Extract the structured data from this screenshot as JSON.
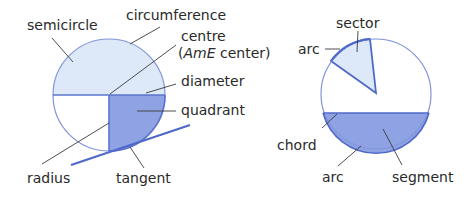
{
  "diagram": {
    "left_figure": {
      "labels": {
        "semicircle": "semicircle",
        "circumference": "circumference",
        "centre": "centre",
        "centre_amE_prefix": "(",
        "centre_amE_italic": "AmE",
        "centre_amE_suffix": " center)",
        "diameter": "diameter",
        "quadrant": "quadrant",
        "radius": "radius",
        "tangent": "tangent"
      }
    },
    "right_figure": {
      "labels": {
        "sector": "sector",
        "arc_top": "arc",
        "chord": "chord",
        "arc_bottom": "arc",
        "segment": "segment"
      }
    },
    "colors": {
      "outline": "#6f86d6",
      "light_fill": "#dde9f8",
      "dark_fill": "#8fa3e4",
      "strong_line": "#4f69c9",
      "leader_line": "#3a3a3a",
      "text": "#2a2a2a"
    }
  }
}
